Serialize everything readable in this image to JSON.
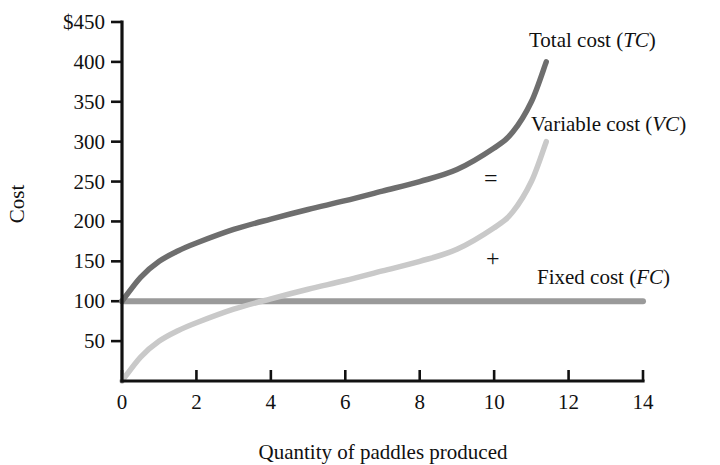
{
  "chart_data": {
    "type": "line",
    "title": "",
    "xlabel": "Quantity of paddles produced",
    "ylabel": "Cost",
    "xlim": [
      0,
      14
    ],
    "ylim": [
      0,
      450
    ],
    "grid": false,
    "legend_position": "inline-right-annotations",
    "x_ticks": [
      "0",
      "2",
      "4",
      "6",
      "8",
      "10",
      "12",
      "14"
    ],
    "x_tick_values": [
      0,
      2,
      4,
      6,
      8,
      10,
      12,
      14
    ],
    "y_ticks": [
      "50",
      "100",
      "150",
      "200",
      "250",
      "300",
      "350",
      "400",
      "$450"
    ],
    "y_tick_values": [
      50,
      100,
      150,
      200,
      250,
      300,
      350,
      400,
      450
    ],
    "y_axis_top_label": "$450",
    "series": [
      {
        "name": "Total cost (TC)",
        "abbr": "TC",
        "color": "#6e6e6e",
        "x": [
          0,
          0.5,
          1,
          1.5,
          2,
          3,
          4,
          5,
          6,
          7,
          8,
          9,
          10,
          10.5,
          11,
          11.4
        ],
        "values": [
          100,
          130,
          150,
          163,
          173,
          190,
          203,
          215,
          226,
          238,
          250,
          265,
          292,
          312,
          350,
          400
        ]
      },
      {
        "name": "Variable cost (VC)",
        "abbr": "VC",
        "color": "#c9c9c9",
        "x": [
          0,
          0.5,
          1,
          1.5,
          2,
          3,
          4,
          5,
          6,
          7,
          8,
          9,
          10,
          10.5,
          11,
          11.4
        ],
        "values": [
          0,
          30,
          50,
          63,
          73,
          90,
          103,
          115,
          126,
          138,
          150,
          165,
          192,
          212,
          250,
          300
        ]
      },
      {
        "name": "Fixed cost (FC)",
        "abbr": "FC",
        "color": "#9a9a9a",
        "x": [
          0,
          14
        ],
        "values": [
          100,
          100
        ]
      }
    ],
    "annotations": [
      {
        "text": "=",
        "x_px": 488,
        "y_px": 178
      },
      {
        "text": "+",
        "x_px": 490,
        "y_px": 260
      }
    ]
  },
  "labels": {
    "total_cost_prefix": "Total cost (",
    "total_cost_abbr": "TC",
    "variable_cost_prefix": "Variable cost (",
    "variable_cost_abbr": "VC",
    "fixed_cost_prefix": "Fixed cost (",
    "fixed_cost_abbr": "FC",
    "paren_close": ")",
    "equals": "=",
    "plus": "+",
    "x_axis_title": "Quantity of paddles produced",
    "y_axis_title": "Cost"
  },
  "colors": {
    "total_cost": "#6e6e6e",
    "variable_cost": "#c9c9c9",
    "fixed_cost": "#9a9a9a",
    "axis": "#111111",
    "background": "#ffffff"
  }
}
